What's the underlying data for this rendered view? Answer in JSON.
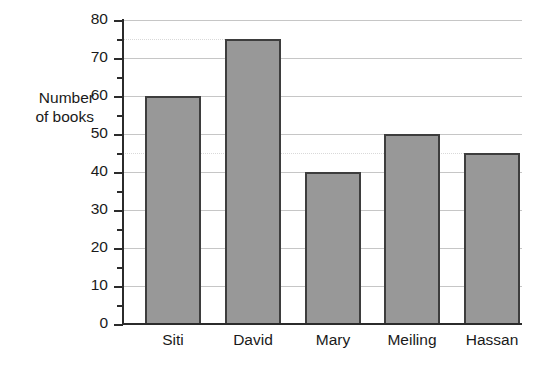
{
  "chart_data": {
    "type": "bar",
    "title": "",
    "xlabel": "",
    "ylabel": "Number\nof books",
    "categories": [
      "Siti",
      "David",
      "Mary",
      "Meiling",
      "Hassan"
    ],
    "values": [
      60,
      75,
      40,
      50,
      45
    ],
    "ylim": [
      0,
      80
    ],
    "y_major_ticks": [
      0,
      10,
      20,
      30,
      40,
      50,
      60,
      70,
      80
    ],
    "y_minor_ticks": [
      5,
      15,
      25,
      35,
      45,
      55,
      65,
      75
    ],
    "y_tick_labels": [
      "0",
      "10",
      "20",
      "30",
      "40",
      "50",
      "60",
      "70",
      "80"
    ],
    "grid": "horizontal",
    "legend": "none",
    "reference_lines": [
      75,
      45
    ],
    "colors": {
      "bar_fill": "#989898",
      "bar_outline": "#3d3d3d",
      "gridline": "#c6c6c6",
      "axis": "#2b2b2b",
      "reference_line": "#d9d9d9",
      "background": "#ffffff",
      "text": "#1a1a1a"
    }
  }
}
